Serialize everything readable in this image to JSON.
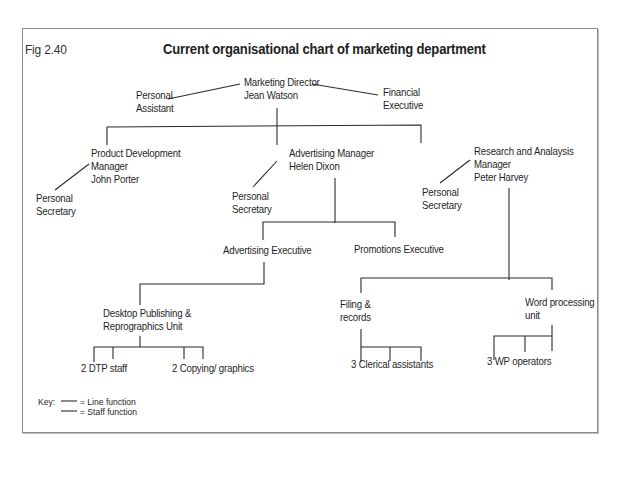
{
  "figure": {
    "label": "Fig 2.40",
    "title": "Current organisational chart of marketing department"
  },
  "nodes": {
    "director": {
      "line1": "Marketing Director",
      "line2": "Jean Watson"
    },
    "personal_assistant": {
      "line1": "Personal",
      "line2": "Assistant"
    },
    "financial_executive": {
      "line1": "Financial",
      "line2": "Executive"
    },
    "product_dev": {
      "line1": "Product Development",
      "line2": "Manager",
      "line3": "John Porter"
    },
    "product_dev_secretary": {
      "line1": "Personal",
      "line2": "Secretary"
    },
    "advertising_manager": {
      "line1": "Advertising Manager",
      "line2": "Helen Dixon"
    },
    "advertising_secretary": {
      "line1": "Personal",
      "line2": "Secretary"
    },
    "research_manager": {
      "line1": "Research and Analaysis",
      "line2": "Manager",
      "line3": "Peter Harvey"
    },
    "research_secretary": {
      "line1": "Personal",
      "line2": "Secretary"
    },
    "advertising_executive": {
      "label": "Advertising Executive"
    },
    "promotions_executive": {
      "label": "Promotions Executive"
    },
    "dtp_unit": {
      "line1": "Desktop Publishing &",
      "line2": "Reprographics Unit"
    },
    "dtp_staff": {
      "label": "2 DTP staff"
    },
    "copying_graphics": {
      "label": "2 Copying/ graphics"
    },
    "filing_records": {
      "line1": "Filing &",
      "line2": "records"
    },
    "clerical_assistants": {
      "label": "3 Clerical assistants"
    },
    "word_processing": {
      "line1": "Word processing",
      "line2": "unit"
    },
    "wp_operators": {
      "label": "3 WP operators"
    }
  },
  "key": {
    "label": "Key:",
    "line_function": "= Line function",
    "staff_function": "= Staff function"
  },
  "colors": {
    "line": "#2a2a2a",
    "frame": "#8c8c8c",
    "text": "#1f1f1f"
  }
}
